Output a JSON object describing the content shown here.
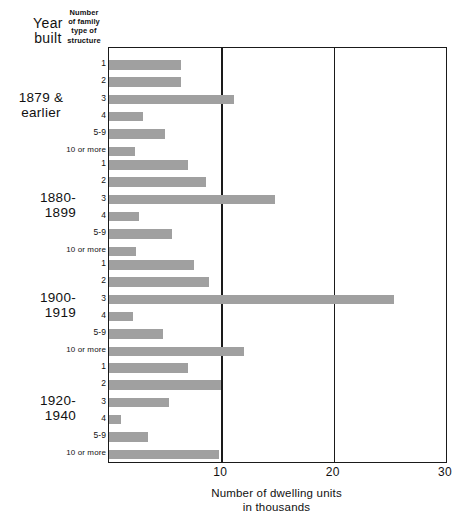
{
  "header": {
    "year_label_line1": "Year",
    "year_label_line2": "built",
    "structure_label_line1": "Number",
    "structure_label_line2": "of family",
    "structure_label_line3": "type of",
    "structure_label_line4": "structure"
  },
  "axis": {
    "title_line1": "Number of dwelling units",
    "title_line2": "in  thousands",
    "ticks": [
      "10",
      "20",
      "30"
    ]
  },
  "chart_data": {
    "type": "bar",
    "orientation": "horizontal",
    "title": "",
    "xlabel": "Number of dwelling units in thousands",
    "ylabel": "Year built / Number of family type of structure",
    "xlim": [
      0,
      30
    ],
    "xticks": [
      10,
      20,
      30
    ],
    "grid": true,
    "bar_color": "#a0a0a0",
    "categories": [
      "1",
      "2",
      "3",
      "4",
      "5-9",
      "10 or more"
    ],
    "groups": [
      {
        "name": "1879 & earlier",
        "label_line1": "1879 &",
        "label_line2": "earlier",
        "values": [
          6.4,
          6.4,
          11.1,
          3.0,
          5.0,
          2.3
        ]
      },
      {
        "name": "1880-1899",
        "label_line1": "1880-",
        "label_line2": "1899",
        "values": [
          7.0,
          8.6,
          14.8,
          2.7,
          5.6,
          2.4
        ]
      },
      {
        "name": "1900-1919",
        "label_line1": "1900-",
        "label_line2": "1919",
        "values": [
          7.6,
          8.9,
          25.4,
          2.1,
          4.8,
          12.0
        ]
      },
      {
        "name": "1920-1940",
        "label_line1": "1920-",
        "label_line2": "1940",
        "values": [
          7.0,
          10.0,
          5.3,
          1.1,
          3.5,
          9.8
        ]
      }
    ]
  }
}
